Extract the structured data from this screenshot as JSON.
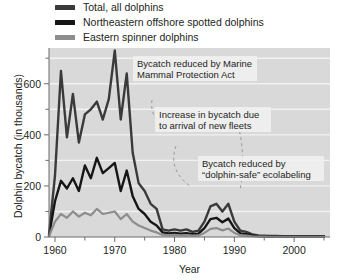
{
  "legend": {
    "items": [
      {
        "label": "Total, all dolphins",
        "color": "#3a3a3a",
        "swatch_name": "legend-swatch-total"
      },
      {
        "label": "Northeastern offshore spotted dolphins",
        "color": "#161616",
        "swatch_name": "legend-swatch-spotted"
      },
      {
        "label": "Eastern spinner dolphins",
        "color": "#8d8d8d",
        "swatch_name": "legend-swatch-spinner"
      }
    ]
  },
  "axes": {
    "ylabel": "Dolphin bycatch (in thousands)",
    "xlabel": "Year",
    "ytick_labels": [
      "0",
      "200",
      "400",
      "600"
    ],
    "xtick_labels": [
      "1960",
      "1970",
      "1980",
      "1990",
      "2000"
    ]
  },
  "annotations": [
    {
      "name": "annotation-mmpa",
      "lines": [
        "Bycatch reduced by Marine",
        "Mammal Protection Act"
      ]
    },
    {
      "name": "annotation-new-fleets",
      "lines": [
        "Increase in bycatch due",
        "to arrival of new fleets"
      ]
    },
    {
      "name": "annotation-dolphin-safe",
      "lines": [
        "Bycatch reduced by",
        "“dolphin-safe” ecolabeling"
      ]
    }
  ],
  "colors": {
    "plot_background": "#d9d9d9",
    "gridline": "#f2f2f2",
    "axis": "#6b6b6b",
    "annotation_box": "#f0f0f0",
    "leader_line": "#9a9a9a"
  },
  "chart_data": {
    "type": "line",
    "title": "",
    "xlabel": "Year",
    "ylabel": "Dolphin bycatch (in thousands)",
    "xlim": [
      1959,
      2006
    ],
    "ylim": [
      0,
      740
    ],
    "ytick_values": [
      0,
      200,
      400,
      600
    ],
    "yminor_tick_values": [
      100,
      300,
      500,
      700
    ],
    "xtick_values": [
      1960,
      1970,
      1980,
      1990,
      2000
    ],
    "xminor_tick_values": [
      1965,
      1975,
      1985,
      1995,
      2005
    ],
    "grid": "horizontal",
    "legend_position": "above-plot",
    "x": [
      1959,
      1960,
      1961,
      1962,
      1963,
      1964,
      1965,
      1966,
      1967,
      1968,
      1969,
      1970,
      1971,
      1972,
      1973,
      1974,
      1975,
      1976,
      1977,
      1978,
      1979,
      1980,
      1981,
      1982,
      1983,
      1984,
      1985,
      1986,
      1987,
      1988,
      1989,
      1990,
      1991,
      1992,
      1993,
      1994,
      1995,
      1996,
      1997,
      1998,
      1999,
      2000,
      2001,
      2002,
      2003,
      2004,
      2005
    ],
    "series": [
      {
        "name": "Total, all dolphins",
        "color": "#3a3a3a",
        "values": [
          10,
          240,
          650,
          390,
          560,
          370,
          480,
          500,
          530,
          460,
          540,
          730,
          460,
          640,
          330,
          210,
          180,
          130,
          110,
          30,
          25,
          30,
          25,
          30,
          20,
          25,
          60,
          120,
          130,
          100,
          130,
          60,
          25,
          20,
          10,
          6,
          5,
          4,
          4,
          3,
          3,
          3,
          3,
          3,
          3,
          3,
          3
        ]
      },
      {
        "name": "Northeastern offshore spotted dolphins",
        "color": "#161616",
        "values": [
          5,
          140,
          220,
          190,
          230,
          180,
          280,
          230,
          310,
          250,
          270,
          290,
          180,
          260,
          160,
          110,
          90,
          60,
          45,
          18,
          14,
          16,
          13,
          15,
          11,
          13,
          35,
          70,
          75,
          58,
          72,
          35,
          14,
          11,
          6,
          4,
          3,
          2,
          2,
          2,
          2,
          2,
          2,
          2,
          2,
          2,
          2
        ]
      },
      {
        "name": "Eastern spinner dolphins",
        "color": "#8d8d8d",
        "values": [
          3,
          60,
          90,
          75,
          100,
          80,
          95,
          85,
          110,
          90,
          95,
          100,
          70,
          90,
          60,
          45,
          35,
          25,
          18,
          8,
          7,
          8,
          6,
          7,
          5,
          6,
          16,
          32,
          35,
          26,
          33,
          16,
          7,
          5,
          3,
          2,
          2,
          1,
          1,
          1,
          1,
          1,
          1,
          1,
          1,
          1,
          1
        ]
      }
    ]
  }
}
